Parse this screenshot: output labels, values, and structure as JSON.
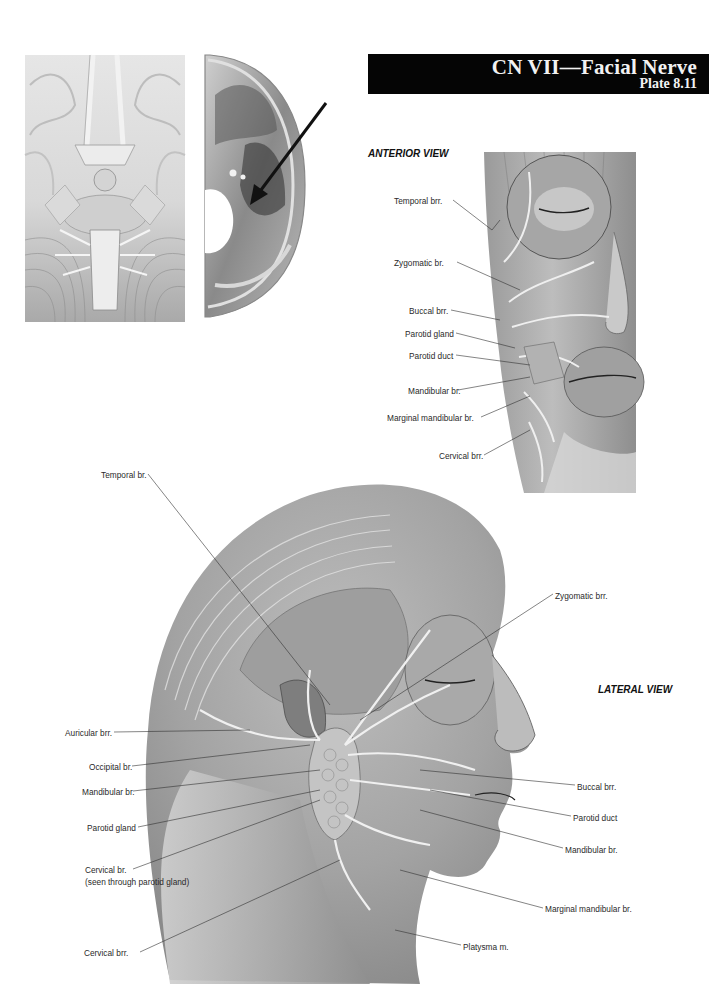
{
  "header": {
    "title": "CN VII—Facial Nerve",
    "plate": "Plate 8.11"
  },
  "top_left_figures": {
    "brain_inferior": {
      "icon": "brainstem-inferior-illustration"
    },
    "skull_base": {
      "icon": "cranial-fossa-illustration",
      "arrow": "pointer-arrow"
    }
  },
  "anterior_view": {
    "title": "ANTERIOR VIEW",
    "labels": [
      "Temporal brr.",
      "Zygomatic br.",
      "Buccal brr.",
      "Parotid gland",
      "Parotid duct",
      "Mandibular br.",
      "Marginal mandibular br.",
      "Cervical brr."
    ]
  },
  "lateral_view": {
    "title": "LATERAL VIEW",
    "labels_left": [
      "Temporal br.",
      "Auricular brr.",
      "Occipital br.",
      "Mandibular br.",
      "Parotid gland",
      "Cervical br.",
      "(seen through parotid gland)",
      "Cervical brr."
    ],
    "labels_right": [
      "Zygomatic brr.",
      "Buccal brr.",
      "Parotid duct",
      "Mandibular br.",
      "Marginal mandibular br.",
      "Platysma m."
    ]
  }
}
